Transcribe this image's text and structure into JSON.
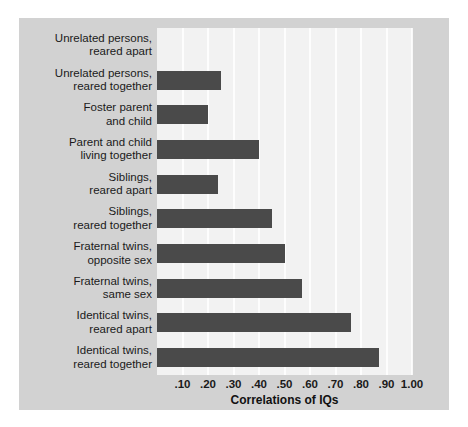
{
  "chart_data": {
    "type": "bar",
    "orientation": "horizontal",
    "title": "",
    "xlabel": "Correlations of IQs",
    "ylabel": "",
    "xlim": [
      0,
      1.0
    ],
    "xticks": [
      0.1,
      0.2,
      0.3,
      0.4,
      0.5,
      0.6,
      0.7,
      0.8,
      0.9,
      1.0
    ],
    "xtick_labels": [
      ".10",
      ".20",
      ".30",
      ".40",
      ".50",
      ".60",
      ".70",
      ".80",
      ".90",
      "1.00"
    ],
    "grid": true,
    "grid_axis": "x",
    "legend": null,
    "categories": [
      "Unrelated persons, reared apart",
      "Unrelated persons, reared together",
      "Foster parent and child",
      "Parent and child living together",
      "Siblings, reared apart",
      "Siblings, reared together",
      "Fraternal twins, opposite sex",
      "Fraternal twins, same sex",
      "Identical twins, reared apart",
      "Identical twins, reared together"
    ],
    "category_lines": [
      [
        "Unrelated persons,",
        "reared apart"
      ],
      [
        "Unrelated persons,",
        "reared together"
      ],
      [
        "Foster parent",
        "and child"
      ],
      [
        "Parent and child",
        "living together"
      ],
      [
        "Siblings,",
        "reared apart"
      ],
      [
        "Siblings,",
        "reared together"
      ],
      [
        "Fraternal twins,",
        "opposite sex"
      ],
      [
        "Fraternal twins,",
        "same sex"
      ],
      [
        "Identical twins,",
        "reared apart"
      ],
      [
        "Identical twins,",
        "reared together"
      ]
    ],
    "values": [
      0.0,
      0.25,
      0.2,
      0.4,
      0.24,
      0.45,
      0.5,
      0.57,
      0.76,
      0.87
    ]
  },
  "colors": {
    "bar": "#4a4a4a",
    "plot_background": "#f2f2f2",
    "panel_background": "#d2d2d2",
    "gridline": "#ffffff",
    "text": "#1a1a1a",
    "figure_background": "#ffffff"
  }
}
